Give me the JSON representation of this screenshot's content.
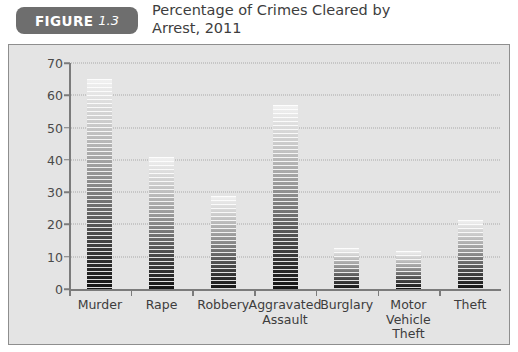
{
  "figure": {
    "badge_word": "FIGURE",
    "badge_number": "1.3",
    "title": "Percentage of Crimes Cleared by\nArrest, 2011",
    "badge_color": "#6e6e6e",
    "panel_bg": "#e4e4e4",
    "panel_border": "#8e8e8e"
  },
  "chart_data": {
    "type": "bar",
    "title": "Percentage of Crimes Cleared by Arrest, 2011",
    "xlabel": "",
    "ylabel": "",
    "ylim": [
      0,
      70
    ],
    "yticks": [
      0,
      10,
      20,
      30,
      40,
      50,
      60,
      70
    ],
    "ytick_labels": [
      "0",
      "10",
      "20",
      "30",
      "40",
      "50",
      "60",
      "70"
    ],
    "grid": true,
    "legend": "none",
    "categories": [
      "Murder",
      "Rape",
      "Robbery",
      "Aggravated\nAssault",
      "Burglary",
      "Motor\nVehicle\nTheft",
      "Theft"
    ],
    "values": [
      65,
      41,
      28.7,
      57,
      12.7,
      11.9,
      21.5
    ],
    "series": [
      {
        "name": "Percentage cleared by arrest",
        "values": [
          65,
          41,
          28.7,
          57,
          12.7,
          11.9,
          21.5
        ]
      }
    ],
    "bar_style": "horizontal-striped gradient, light at top to black at bottom"
  }
}
